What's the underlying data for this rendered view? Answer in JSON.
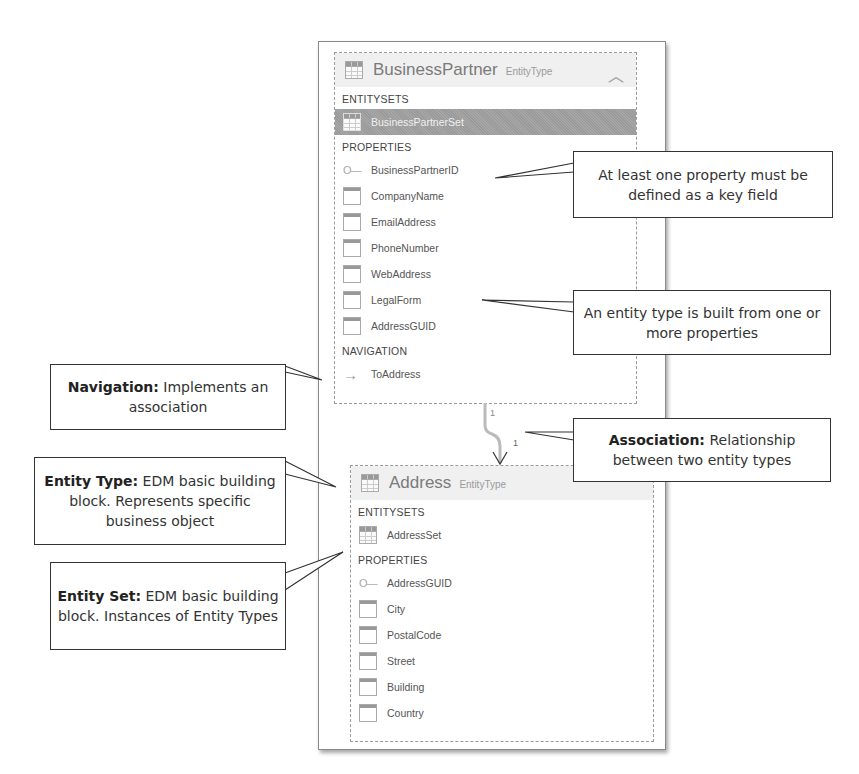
{
  "entities": [
    {
      "name": "BusinessPartner",
      "kind": "EntityType",
      "collapse_icon": "chevron-up-icon",
      "entitysets_label": "ENTITYSETS",
      "entitysets": [
        {
          "name": "BusinessPartnerSet",
          "selected": true
        }
      ],
      "properties_label": "PROPERTIES",
      "properties": [
        {
          "name": "BusinessPartnerID",
          "key": true
        },
        {
          "name": "CompanyName",
          "key": false
        },
        {
          "name": "EmailAddress",
          "key": false
        },
        {
          "name": "PhoneNumber",
          "key": false
        },
        {
          "name": "WebAddress",
          "key": false
        },
        {
          "name": "LegalForm",
          "key": false
        },
        {
          "name": "AddressGUID",
          "key": false
        }
      ],
      "navigation_label": "NAVIGATION",
      "navigation": [
        {
          "name": "ToAddress"
        }
      ]
    },
    {
      "name": "Address",
      "kind": "EntityType",
      "entitysets_label": "ENTITYSETS",
      "entitysets": [
        {
          "name": "AddressSet",
          "selected": false
        }
      ],
      "properties_label": "PROPERTIES",
      "properties": [
        {
          "name": "AddressGUID",
          "key": true
        },
        {
          "name": "City",
          "key": false
        },
        {
          "name": "PostalCode",
          "key": false
        },
        {
          "name": "Street",
          "key": false
        },
        {
          "name": "Building",
          "key": false
        },
        {
          "name": "Country",
          "key": false
        }
      ]
    }
  ],
  "association": {
    "source_multiplicity": "1",
    "target_multiplicity": "1"
  },
  "callouts": {
    "key_field": {
      "text": "At least one property must be defined as a key field"
    },
    "properties": {
      "text": "An entity type is built from one or more properties"
    },
    "navigation": {
      "bold": "Navigation:",
      "text": " Implements an association"
    },
    "association": {
      "bold": "Association:",
      "text": " Relationship between two entity types"
    },
    "entity_type": {
      "bold": "Entity Type:",
      "text": " EDM basic building block. Represents specific business object"
    },
    "entity_set": {
      "bold": "Entity Set:",
      "text": " EDM basic building block. Instances of Entity Types"
    }
  }
}
